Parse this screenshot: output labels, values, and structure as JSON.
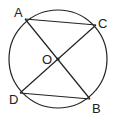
{
  "diagram": {
    "type": "circle-geometry",
    "circle": {
      "cx": 58,
      "cy": 59,
      "r": 49
    },
    "center": {
      "name": "O",
      "x": 58,
      "y": 59
    },
    "points": [
      {
        "name": "A",
        "x": 25,
        "y": 19,
        "label_x": 14,
        "label_y": 17
      },
      {
        "name": "C",
        "x": 96,
        "y": 25,
        "label_x": 99,
        "label_y": 28
      },
      {
        "name": "D",
        "x": 20,
        "y": 93,
        "label_x": 9,
        "label_y": 104
      },
      {
        "name": "B",
        "x": 90,
        "y": 99,
        "label_x": 92,
        "label_y": 113
      }
    ],
    "segments": [
      {
        "from": "A",
        "to": "C"
      },
      {
        "from": "A",
        "to": "B"
      },
      {
        "from": "C",
        "to": "D"
      },
      {
        "from": "D",
        "to": "B"
      }
    ],
    "labels": {
      "A": "A",
      "B": "B",
      "C": "C",
      "D": "D",
      "O": "O"
    },
    "stroke_color": "#222222"
  }
}
